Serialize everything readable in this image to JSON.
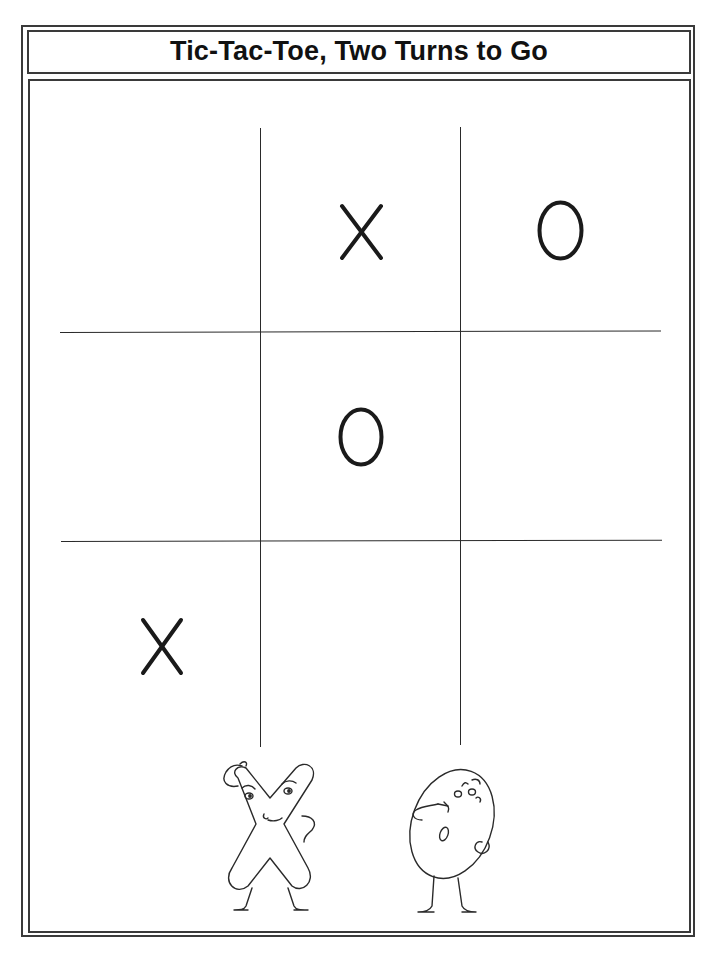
{
  "title": "Tic-Tac-Toe, Two Turns to Go",
  "board": {
    "rows": [
      [
        "",
        "X",
        "O"
      ],
      [
        "",
        "O",
        ""
      ],
      [
        "X",
        "",
        ""
      ]
    ],
    "cells": [
      {
        "row": 0,
        "col": 1,
        "mark": "X"
      },
      {
        "row": 0,
        "col": 2,
        "mark": "O"
      },
      {
        "row": 1,
        "col": 1,
        "mark": "O"
      },
      {
        "row": 2,
        "col": 0,
        "mark": "X"
      }
    ]
  },
  "illustrations": [
    {
      "name": "x-character",
      "description": "Cartoon X scratching its head, hand on hip"
    },
    {
      "name": "o-character",
      "description": "Cartoon O pointing at itself, hand on hip"
    }
  ],
  "colors": {
    "ink": "#1a1a1a",
    "paper": "#ffffff"
  }
}
